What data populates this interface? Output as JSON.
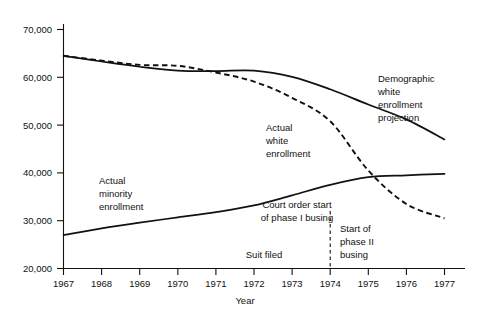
{
  "chart_data": {
    "type": "line",
    "title": "",
    "xlabel": "Year",
    "ylabel": "",
    "xlim": [
      1967,
      1977
    ],
    "ylim": [
      20000,
      70000
    ],
    "grid": false,
    "legend_position": "inline-annotations",
    "x": [
      1967,
      1968,
      1969,
      1970,
      1971,
      1972,
      1973,
      1974,
      1975,
      1976,
      1977
    ],
    "xticklabels": [
      "1967",
      "1968",
      "1969",
      "1970",
      "1971",
      "1972",
      "1973",
      "1974",
      "1975",
      "1976",
      "1977"
    ],
    "yticklabels": [
      "20,000",
      "30,000",
      "40,000",
      "50,000",
      "60,000",
      "70,000"
    ],
    "ytickvalues": [
      20000,
      30000,
      40000,
      50000,
      60000,
      70000
    ],
    "series": [
      {
        "name": "Demographic white enrollment projection",
        "style": "solid",
        "values": [
          64500,
          63300,
          62200,
          61400,
          61300,
          61400,
          60100,
          57500,
          54300,
          51200,
          47000
        ]
      },
      {
        "name": "Actual white enrollment",
        "style": "dashed",
        "values": [
          64500,
          63500,
          62600,
          62400,
          61000,
          59100,
          55700,
          50800,
          40500,
          33500,
          30500
        ]
      },
      {
        "name": "Actual minority enrollment",
        "style": "solid",
        "values": [
          27000,
          28400,
          29600,
          30700,
          31800,
          33200,
          35300,
          37500,
          39100,
          39500,
          39800
        ]
      }
    ],
    "annotations": [
      {
        "name": "demographic-white-enrollment-projection",
        "lines": [
          "Demographic",
          "white",
          "enrollment",
          "projection"
        ],
        "align": "left"
      },
      {
        "name": "actual-white-enrollment",
        "lines": [
          "Actual",
          "white",
          "enrollment"
        ],
        "align": "left"
      },
      {
        "name": "actual-minority-enrollment",
        "lines": [
          "Actual",
          "minority",
          "enrollment"
        ],
        "align": "left"
      },
      {
        "name": "court-order-start-of-phase-i-busing",
        "lines": [
          "Court order start",
          "of phase I busing"
        ],
        "align": "center",
        "event_year": 1974
      },
      {
        "name": "start-of-phase-ii-busing",
        "lines": [
          "Start of",
          "phase II",
          "busing"
        ],
        "align": "left"
      },
      {
        "name": "suit-filed",
        "lines": [
          "Suit filed"
        ],
        "align": "center"
      }
    ]
  },
  "axes": {
    "x_title": "Year",
    "y_ticks": [
      "70,000",
      "60,000",
      "50,000",
      "40,000",
      "30,000",
      "20,000"
    ],
    "x_ticks": [
      "1967",
      "1968",
      "1969",
      "1970",
      "1971",
      "1972",
      "1973",
      "1974",
      "1975",
      "1976",
      "1977"
    ]
  },
  "labels": {
    "demographic": {
      "l1": "Demographic",
      "l2": "white",
      "l3": "enrollment",
      "l4": "projection"
    },
    "actual_white": {
      "l1": "Actual",
      "l2": "white",
      "l3": "enrollment"
    },
    "actual_minority": {
      "l1": "Actual",
      "l2": "minority",
      "l3": "enrollment"
    },
    "court_order": {
      "l1": "Court order start",
      "l2": "of phase I busing"
    },
    "phase_two": {
      "l1": "Start of",
      "l2": "phase II",
      "l3": "busing"
    },
    "suit_filed": {
      "l1": "Suit filed"
    }
  },
  "colors": {
    "ink": "#111111",
    "background": "#ffffff"
  }
}
